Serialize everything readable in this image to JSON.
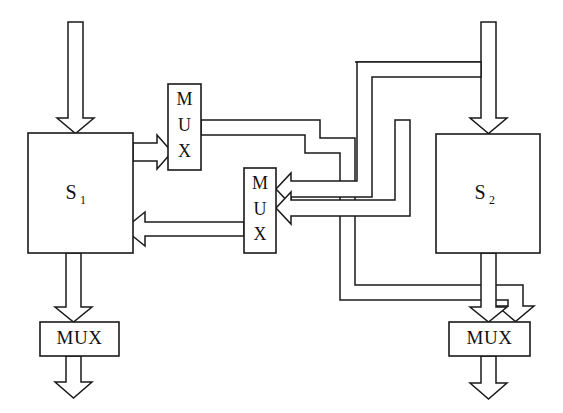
{
  "figure": {
    "kind": "block-diagram",
    "background_color": "#ffffff",
    "line_color": "#1a1a1a",
    "width": 563,
    "height": 413
  },
  "blocks": {
    "system_left": {
      "label": "S",
      "subscript": "1",
      "x": 28,
      "y": 133,
      "w": 105,
      "h": 120
    },
    "system_right": {
      "label": "S",
      "subscript": "2",
      "x": 436,
      "y": 134,
      "w": 104,
      "h": 119
    },
    "mux_top": {
      "label": "MUX",
      "orientation": "vertical",
      "letters": [
        "M",
        "U",
        "X"
      ],
      "x": 168,
      "y": 84,
      "w": 33,
      "h": 86
    },
    "mux_middle": {
      "label": "MUX",
      "orientation": "vertical",
      "letters": [
        "M",
        "U",
        "X"
      ],
      "x": 244,
      "y": 168,
      "w": 32,
      "h": 85
    },
    "mux_bottom_left": {
      "label": "MUX",
      "orientation": "horizontal",
      "x": 40,
      "y": 322,
      "w": 79,
      "h": 34
    },
    "mux_bottom_right": {
      "label": "MUX",
      "orientation": "horizontal",
      "x": 449,
      "y": 322,
      "w": 81,
      "h": 34
    }
  },
  "arrows": {
    "input_to_system_left": "down",
    "input_to_system_right": "down",
    "system_left_to_mux_top": "right",
    "mux_middle_to_system_left": "left",
    "bus_to_mux_middle_upper": "left",
    "bus_to_mux_middle_lower": "left",
    "system_left_to_mux_bottom_left": "down",
    "mux_bottom_left_output": "down",
    "system_right_to_mux_bottom_right": "down",
    "mux_bottom_right_output": "down"
  }
}
